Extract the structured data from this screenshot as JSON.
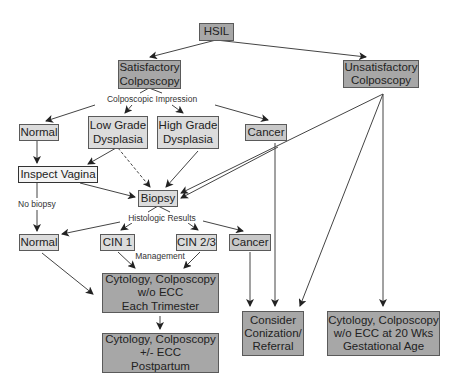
{
  "diagram": {
    "nodes": {
      "hsil": "HSIL",
      "satisfactory": "Satisfactory\nColposcopy",
      "unsatisfactory": "Unsatisfactory\nColposcopy",
      "normal_1": "Normal",
      "low_grade": "Low Grade\nDysplasia",
      "high_grade": "High Grade\nDysplasia",
      "cancer_1": "Cancer",
      "inspect_vagina": "Inspect Vagina",
      "biopsy": "Biopsy",
      "normal_2": "Normal",
      "cin1": "CIN 1",
      "cin23": "CIN 2/3",
      "cancer_2": "Cancer",
      "cyto_trimester": "Cytology, Colposcopy\nw/o ECC\nEach Trimester",
      "cyto_postpartum": "Cytology, Colposcopy\n+/- ECC\nPostpartum",
      "conization": "Consider\nConization/\nReferral",
      "cyto_20wks": "Cytology, Colposcopy\nw/o ECC at 20 Wks\nGestational Age"
    },
    "labels": {
      "colposcopic_impression": "Colposcopic Impression",
      "no_biopsy": "No biopsy",
      "histologic_results": "Histologic Results",
      "management": "Management"
    },
    "colors": {
      "dark_box": "#a7a7a7",
      "light_box": "#dcdcdc",
      "line": "#444444"
    }
  }
}
